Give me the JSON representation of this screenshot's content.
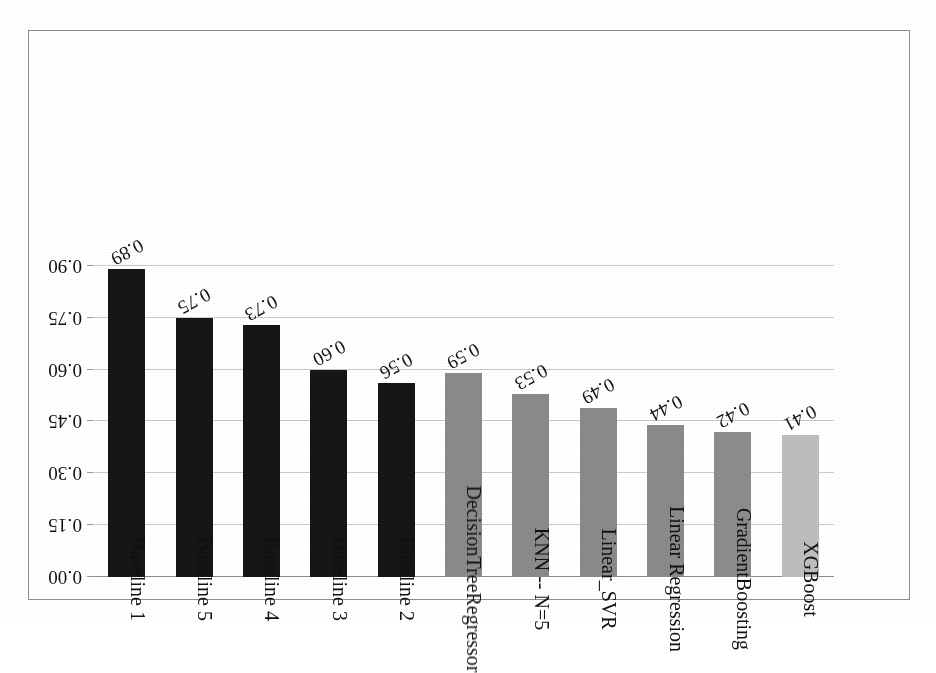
{
  "figure": {
    "rotation_degrees": 180,
    "background_color": "#ffffff",
    "frame_color": "#8e8e8e",
    "gridline_color": "#c9c9c9"
  },
  "chart_data": {
    "type": "bar",
    "title": "",
    "subtitle": "",
    "xlabel": "",
    "ylabel": "",
    "orientation": "vertical",
    "grid": true,
    "legend": "none",
    "ylim": [
      0.0,
      0.9
    ],
    "ytick_labels": [
      "0.00",
      "0.15",
      "0.30",
      "0.45",
      "0.60",
      "0.75",
      "0.90"
    ],
    "ytick_values": [
      0.0,
      0.15,
      0.3,
      0.45,
      0.6,
      0.75,
      0.9
    ],
    "categories": [
      "XGBoost",
      "GradientBoosting",
      "Linear Regression",
      "Linear_SVR",
      "KNN -- N=5",
      "DecisionTree Regressor",
      "Baseline 2",
      "Baseline 3",
      "Baseline 4",
      "Baseline 5",
      "Baseline 1"
    ],
    "values": [
      0.41,
      0.42,
      0.44,
      0.49,
      0.53,
      0.59,
      0.56,
      0.6,
      0.73,
      0.75,
      0.89
    ],
    "data_labels": [
      "0.41",
      "0.42",
      "0.44",
      "0.49",
      "0.53",
      "0.59",
      "0.56",
      "0.60",
      "0.73",
      "0.75",
      "0.89"
    ],
    "bar_colors": [
      "#bdbdbd",
      "#8c8c8c",
      "#8a8a8a",
      "#8a8a8a",
      "#8a8a8a",
      "#8a8a8a",
      "#161616",
      "#161616",
      "#161616",
      "#161616",
      "#161616"
    ],
    "category_label_lines": [
      [
        "XGBoost"
      ],
      [
        "GradientBoosting"
      ],
      [
        "Linear Regression"
      ],
      [
        "Linear_SVR"
      ],
      [
        "KNN --  N=5"
      ],
      [
        "DecisionTree",
        "Regressor"
      ],
      [
        "Baseline 2"
      ],
      [
        "Baseline 3"
      ],
      [
        "Baseline 4"
      ],
      [
        "Baseline 5"
      ],
      [
        "Baseline 1"
      ]
    ]
  }
}
